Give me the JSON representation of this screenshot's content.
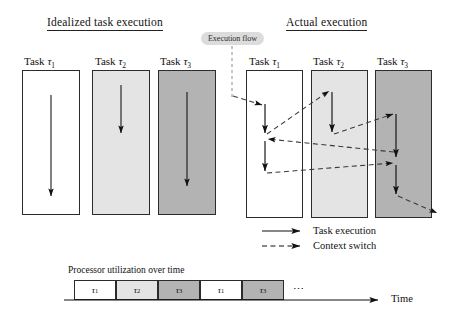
{
  "figure": {
    "title_left": "Idealized task execution",
    "title_right": "Actual execution",
    "callout": "Execution flow"
  },
  "idealized": {
    "tasks": [
      {
        "name": "Task",
        "tau": "τ",
        "index": "1",
        "fill": "#ffffff"
      },
      {
        "name": "Task",
        "tau": "τ",
        "index": "2",
        "fill": "#e4e4e4"
      },
      {
        "name": "Task",
        "tau": "τ",
        "index": "3",
        "fill": "#b3b3b3"
      }
    ]
  },
  "actual": {
    "tasks": [
      {
        "name": "Task",
        "tau": "τ",
        "index": "1",
        "fill": "#ffffff"
      },
      {
        "name": "Task",
        "tau": "τ",
        "index": "2",
        "fill": "#e4e4e4"
      },
      {
        "name": "Task",
        "tau": "τ",
        "index": "3",
        "fill": "#b3b3b3"
      }
    ]
  },
  "legend": {
    "items": [
      {
        "label": "Task execution",
        "style": "solid-arrow"
      },
      {
        "label": "Context switch",
        "style": "dashed-arrow"
      }
    ]
  },
  "timeline": {
    "caption": "Processor utilization over time",
    "axis_label": "Time",
    "ellipsis": "⋯",
    "slots": [
      {
        "tau": "τ",
        "index": "1",
        "fill": "#ffffff"
      },
      {
        "tau": "τ",
        "index": "2",
        "fill": "#e4e4e4"
      },
      {
        "tau": "τ",
        "index": "3",
        "fill": "#b3b3b3"
      },
      {
        "tau": "τ",
        "index": "1",
        "fill": "#ffffff"
      },
      {
        "tau": "τ",
        "index": "3",
        "fill": "#b3b3b3"
      }
    ]
  },
  "colors": {
    "stroke": "#2b2b2b",
    "arrow": "#111111",
    "fill_white": "#ffffff",
    "fill_light": "#e4e4e4",
    "fill_dark": "#b3b3b3",
    "callout_bg": "#dcdcdc"
  }
}
